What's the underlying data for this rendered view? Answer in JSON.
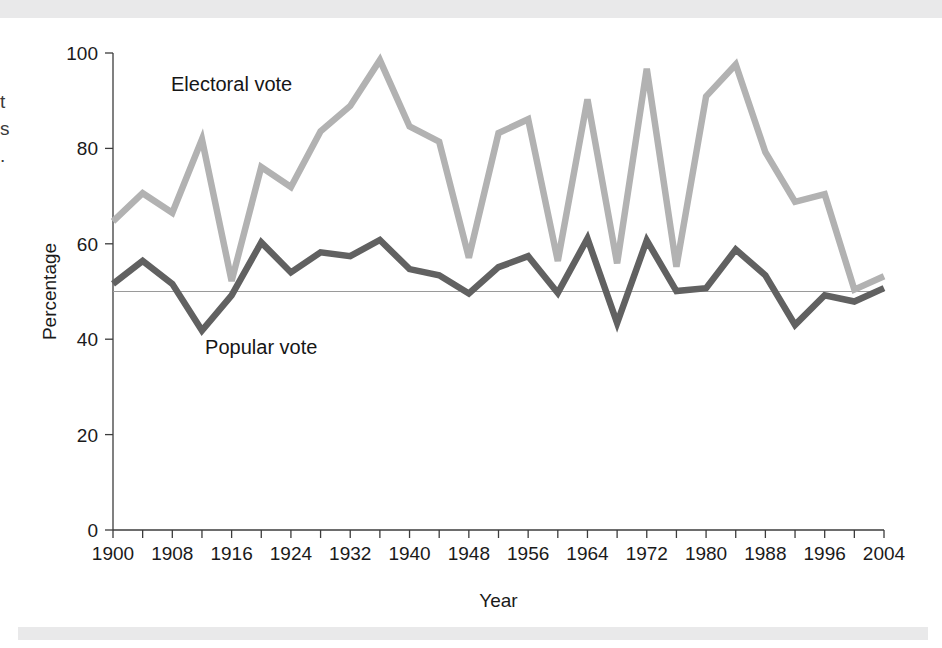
{
  "figure": {
    "background_color": "#ffffff",
    "decor_bar_color": "#e9e9ea",
    "edge_text_fragments": [
      "t",
      "s",
      "."
    ]
  },
  "chart_data": {
    "type": "line",
    "title": "",
    "xlabel": "Year",
    "ylabel": "Percentage",
    "xlim": [
      1900,
      2004
    ],
    "ylim": [
      0,
      100
    ],
    "xtick_step": 8,
    "xtick_minor_step": 4,
    "ytick_step": 20,
    "grid": false,
    "legend_position": "inline-annotations",
    "reference_line": {
      "value": 50,
      "color": "#9a9a9a",
      "label": ""
    },
    "xticks": [
      1900,
      1908,
      1916,
      1924,
      1932,
      1940,
      1948,
      1956,
      1964,
      1972,
      1980,
      1988,
      1996,
      2004
    ],
    "xtick_labels": [
      "1900",
      "1908",
      "1916",
      "1924",
      "1932",
      "1940",
      "1948",
      "1956",
      "1964",
      "1972",
      "1980",
      "1988",
      "1996",
      "2004"
    ],
    "yticks": [
      0,
      20,
      40,
      60,
      80,
      100
    ],
    "ytick_labels": [
      "0",
      "20",
      "40",
      "60",
      "80",
      "100"
    ],
    "x": [
      1900,
      1904,
      1908,
      1912,
      1916,
      1920,
      1924,
      1928,
      1932,
      1936,
      1940,
      1944,
      1948,
      1952,
      1956,
      1960,
      1964,
      1968,
      1972,
      1976,
      1980,
      1984,
      1988,
      1992,
      1996,
      2000,
      2004
    ],
    "series": [
      {
        "name": "Electoral vote",
        "color": "#b2b2b2",
        "label_x": 1916,
        "label_y": 92,
        "values": [
          64.7,
          70.6,
          66.5,
          81.9,
          52.2,
          76.1,
          71.9,
          83.6,
          88.9,
          98.5,
          84.6,
          81.4,
          57.1,
          83.2,
          86.1,
          56.4,
          90.3,
          55.9,
          96.7,
          55.2,
          90.9,
          97.6,
          79.2,
          68.8,
          70.4,
          50.4,
          53.2
        ]
      },
      {
        "name": "Popular vote",
        "color": "#616161",
        "label_x": 1920,
        "label_y": 37,
        "values": [
          51.6,
          56.4,
          51.6,
          41.8,
          49.2,
          60.3,
          54.0,
          58.2,
          57.4,
          60.8,
          54.7,
          53.4,
          49.6,
          55.1,
          57.4,
          49.7,
          61.1,
          43.4,
          60.7,
          50.1,
          50.7,
          58.8,
          53.4,
          43.0,
          49.2,
          47.9,
          50.7
        ]
      }
    ]
  }
}
